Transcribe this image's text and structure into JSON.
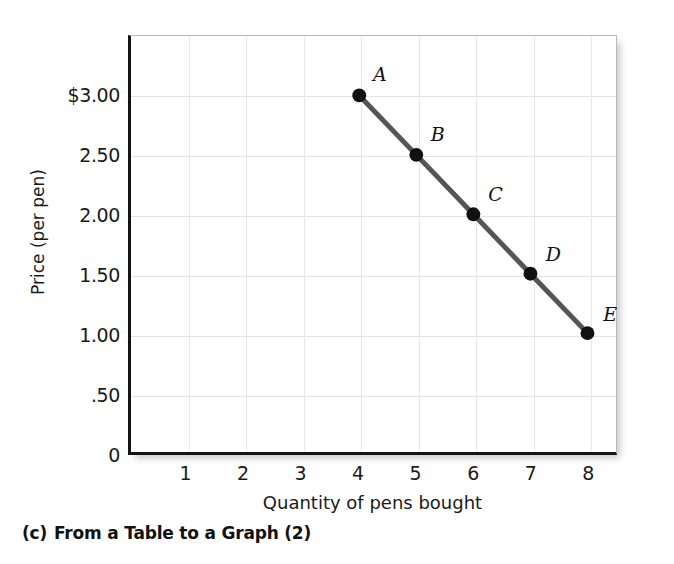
{
  "caption": {
    "index": "(c)",
    "text": "From a Table to a Graph (2)"
  },
  "chart_data": {
    "type": "line",
    "title": "",
    "subtitle": "",
    "xlabel": "Quantity of pens bought",
    "ylabel": "Price (per pen)",
    "xlim": [
      0,
      8.5
    ],
    "ylim": [
      0,
      3.5
    ],
    "grid": true,
    "legend": "none",
    "x_tick_labels": [
      "1",
      "2",
      "3",
      "4",
      "5",
      "6",
      "7",
      "8"
    ],
    "x_tick_values": [
      1,
      2,
      3,
      4,
      5,
      6,
      7,
      8
    ],
    "y_tick_labels": [
      "0",
      ".50",
      "1.00",
      "1.50",
      "2.00",
      "2.50",
      "$3.00"
    ],
    "y_tick_values": [
      0,
      0.5,
      1.0,
      1.5,
      2.0,
      2.5,
      3.0
    ],
    "series": [
      {
        "name": "Demand",
        "line_color": "#555555",
        "marker_color": "#111111",
        "points": [
          {
            "label": "A",
            "x": 4,
            "y": 3.0
          },
          {
            "label": "B",
            "x": 5,
            "y": 2.5
          },
          {
            "label": "C",
            "x": 6,
            "y": 2.0
          },
          {
            "label": "D",
            "x": 7,
            "y": 1.5
          },
          {
            "label": "E",
            "x": 8,
            "y": 1.0
          }
        ]
      }
    ],
    "colors": {
      "axis": "#141414",
      "grid": "#e4e4e4",
      "frame": "#b9b9b9",
      "line": "#555555",
      "marker": "#111111",
      "text": "#1a1a1a"
    }
  }
}
